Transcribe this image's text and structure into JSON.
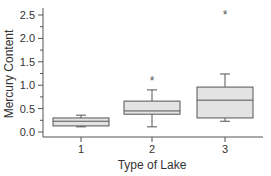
{
  "chart_data": {
    "type": "boxplot",
    "title": "",
    "xlabel": "Type of Lake",
    "ylabel": "Mercury Content",
    "categories": [
      "1",
      "2",
      "3"
    ],
    "ylim": [
      -0.05,
      2.65
    ],
    "yticks": [
      "0.0",
      "0.5",
      "1.0",
      "1.5",
      "2.0",
      "2.5"
    ],
    "ytick_values": [
      0.0,
      0.5,
      1.0,
      1.5,
      2.0,
      2.5
    ],
    "boxes": [
      {
        "category": "1",
        "whisker_low": 0.11,
        "q1": 0.13,
        "median": 0.23,
        "q3": 0.3,
        "whisker_high": 0.36,
        "outliers": []
      },
      {
        "category": "2",
        "whisker_low": 0.11,
        "q1": 0.38,
        "median": 0.45,
        "q3": 0.66,
        "whisker_high": 0.9,
        "outliers": [
          1.11
        ]
      },
      {
        "category": "3",
        "whisker_low": 0.23,
        "q1": 0.3,
        "median": 0.68,
        "q3": 0.96,
        "whisker_high": 1.24,
        "outliers": [
          2.52
        ]
      }
    ],
    "outlier_marker": "*",
    "box_fill": "#e3e3e3",
    "line_color": "#555555",
    "grid": false,
    "legend": null
  }
}
